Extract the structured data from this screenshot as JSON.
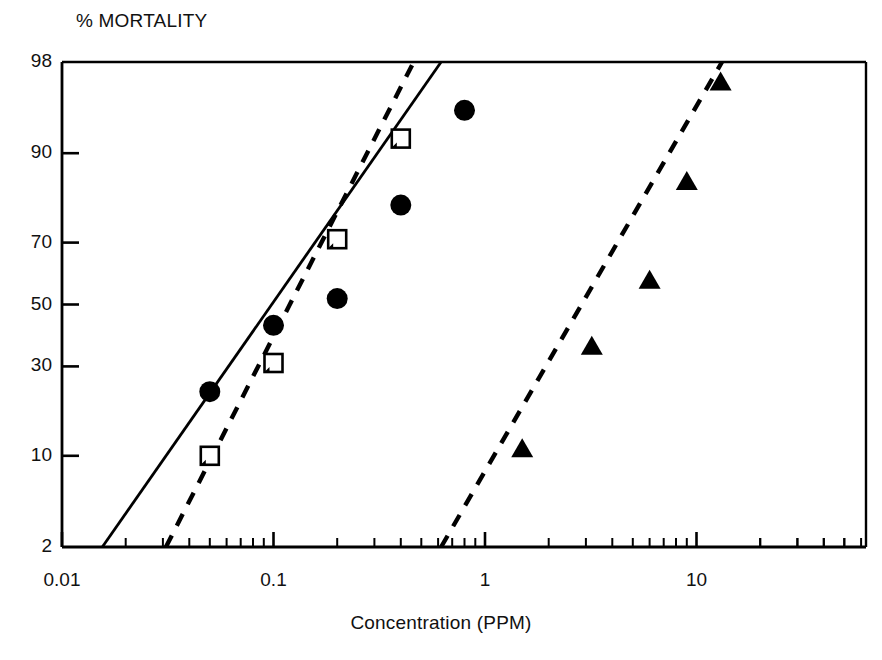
{
  "figure": {
    "background": "#ffffff",
    "ink": "#000000"
  },
  "chart_data": {
    "type": "scatter",
    "title": "",
    "ylabel": "% MORTALITY",
    "xlabel": "Concentration (PPM)",
    "xscale": "log",
    "yscale": "probit",
    "xlim": [
      0.01,
      50
    ],
    "ylim": [
      2,
      98
    ],
    "grid": false,
    "legend": "none",
    "ytick_labels": [
      "98",
      "90",
      "70",
      "50",
      "30",
      "10",
      "2"
    ],
    "ytick_values": [
      98,
      90,
      70,
      50,
      30,
      10,
      2
    ],
    "xtick_labels": [
      "0.01",
      "0.1",
      "1",
      "10"
    ],
    "xtick_values": [
      0.01,
      0.1,
      1,
      10
    ],
    "series": [
      {
        "name": "filled-circle-series",
        "marker": "filled-circle",
        "line": "solid",
        "color": "#000000",
        "points": [
          {
            "x": 0.05,
            "y": 23
          },
          {
            "x": 0.1,
            "y": 43
          },
          {
            "x": 0.2,
            "y": 52
          },
          {
            "x": 0.4,
            "y": 80
          },
          {
            "x": 0.8,
            "y": 95
          }
        ],
        "fit_line": [
          {
            "x": 0.0155,
            "y": 2
          },
          {
            "x": 0.62,
            "y": 98
          }
        ]
      },
      {
        "name": "open-square-series",
        "marker": "open-square",
        "line": "dashed",
        "color": "#000000",
        "points": [
          {
            "x": 0.05,
            "y": 10
          },
          {
            "x": 0.1,
            "y": 31
          },
          {
            "x": 0.2,
            "y": 71
          },
          {
            "x": 0.4,
            "y": 92
          }
        ],
        "fit_line": [
          {
            "x": 0.031,
            "y": 2
          },
          {
            "x": 0.46,
            "y": 98
          }
        ]
      },
      {
        "name": "filled-triangle-series",
        "marker": "filled-triangle",
        "line": "dashed",
        "color": "#000000",
        "points": [
          {
            "x": 1.5,
            "y": 11
          },
          {
            "x": 3.2,
            "y": 36
          },
          {
            "x": 6.0,
            "y": 58
          },
          {
            "x": 9.0,
            "y": 85
          },
          {
            "x": 13.0,
            "y": 97
          }
        ],
        "fit_line": [
          {
            "x": 0.62,
            "y": 2
          },
          {
            "x": 13.2,
            "y": 98
          }
        ]
      }
    ]
  },
  "axes": {
    "ylabel_text": "% MORTALITY",
    "xlabel_text": "Concentration (PPM)",
    "yticks": [
      {
        "label": "98",
        "value": 98
      },
      {
        "label": "90",
        "value": 90
      },
      {
        "label": "70",
        "value": 70
      },
      {
        "label": "50",
        "value": 50
      },
      {
        "label": "30",
        "value": 30
      },
      {
        "label": "10",
        "value": 10
      },
      {
        "label": "2",
        "value": 2
      }
    ],
    "xticks": [
      {
        "label": "0.01",
        "value": 0.01
      },
      {
        "label": "0.1",
        "value": 0.1
      },
      {
        "label": "1",
        "value": 1
      },
      {
        "label": "10",
        "value": 10
      }
    ]
  }
}
